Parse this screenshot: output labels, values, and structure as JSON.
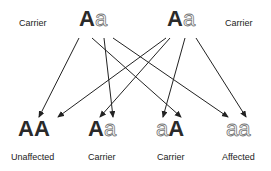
{
  "parents": [
    {
      "label": "Carrier",
      "allele1": "A",
      "allele2": "a"
    },
    {
      "label": "Carrier",
      "allele1": "A",
      "allele2": "a"
    }
  ],
  "offspring": [
    {
      "allele1": "A",
      "allele2": "A",
      "label": "Unaffected"
    },
    {
      "allele1": "A",
      "allele2": "a",
      "label": "Carrier"
    },
    {
      "allele1": "a",
      "allele2": "A",
      "label": "Carrier"
    },
    {
      "allele1": "a",
      "allele2": "a",
      "label": "Affected"
    }
  ],
  "colors": {
    "dominant": "#2a2a2a",
    "recessive_outline": "#777777",
    "arrow": "#222222"
  }
}
